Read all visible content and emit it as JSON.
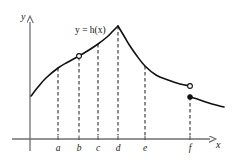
{
  "figure": {
    "title": "",
    "curve_label": "y = h(x)",
    "axis_labels": {
      "x": "x",
      "y": "y"
    },
    "colors": {
      "curve": "#111111",
      "axis": "#6f6f73",
      "dashed": "#3a3a3a",
      "text": "#1a1a1a",
      "background": "#ffffff"
    }
  },
  "chart_data": {
    "type": "line",
    "title": "",
    "subtitle": "",
    "xlabel": "x",
    "ylabel": "y",
    "grid": false,
    "legend": null,
    "annotations": [
      {
        "text": "y = h(x)",
        "x": 75,
        "y": 26
      }
    ],
    "axis": {
      "origin": {
        "x": 30,
        "y": 139
      },
      "x_axis": {
        "x_start": 12,
        "x_end": 214,
        "y": 139,
        "arrow": true
      },
      "y_axis": {
        "y_start": 151,
        "y_end": 18,
        "x": 30,
        "arrow": true
      }
    },
    "tick_labels": [
      "a",
      "b",
      "c",
      "d",
      "e",
      "f"
    ],
    "tick_positions_px": [
      58,
      79,
      98,
      118,
      145,
      190
    ],
    "dashed_verticals": [
      {
        "label": "a",
        "x": 58,
        "y_top": 68,
        "y_bottom": 139
      },
      {
        "label": "b",
        "x": 79,
        "y_top": 57,
        "y_bottom": 139
      },
      {
        "label": "c",
        "x": 98,
        "y_top": 44,
        "y_bottom": 139
      },
      {
        "label": "d",
        "x": 118,
        "y_top": 26,
        "y_bottom": 139
      },
      {
        "label": "e",
        "x": 145,
        "y_top": 66,
        "y_bottom": 139
      },
      {
        "label": "f",
        "x": 190,
        "y_top": 97,
        "y_bottom": 139
      }
    ],
    "curve_points": [
      {
        "x": 31,
        "y": 96
      },
      {
        "x": 38,
        "y": 87
      },
      {
        "x": 46,
        "y": 78
      },
      {
        "x": 58,
        "y": 68
      },
      {
        "x": 68,
        "y": 62
      },
      {
        "x": 79,
        "y": 56
      },
      {
        "x": 89,
        "y": 50
      },
      {
        "x": 98,
        "y": 44
      },
      {
        "x": 107,
        "y": 37
      },
      {
        "x": 113,
        "y": 31
      },
      {
        "x": 118,
        "y": 26
      },
      {
        "x": 124,
        "y": 36
      },
      {
        "x": 130,
        "y": 46
      },
      {
        "x": 137,
        "y": 56
      },
      {
        "x": 145,
        "y": 66
      },
      {
        "x": 156,
        "y": 75
      },
      {
        "x": 168,
        "y": 80
      },
      {
        "x": 180,
        "y": 84
      },
      {
        "x": 190,
        "y": 86
      },
      {
        "x": 190,
        "y": 97
      },
      {
        "x": 200,
        "y": 100
      },
      {
        "x": 212,
        "y": 104
      },
      {
        "x": 224,
        "y": 107
      }
    ],
    "markers": [
      {
        "kind": "open",
        "label": "hole-at-b",
        "x": 79,
        "y": 56
      },
      {
        "kind": "open",
        "label": "hole-at-f",
        "x": 190,
        "y": 86
      },
      {
        "kind": "filled",
        "label": "point-at-f",
        "x": 190,
        "y": 97
      }
    ],
    "features": {
      "peak": {
        "label": "d",
        "x": 118,
        "y": 26,
        "type": "corner"
      },
      "removable_discontinuity": "b",
      "jump_discontinuity": "f"
    }
  }
}
